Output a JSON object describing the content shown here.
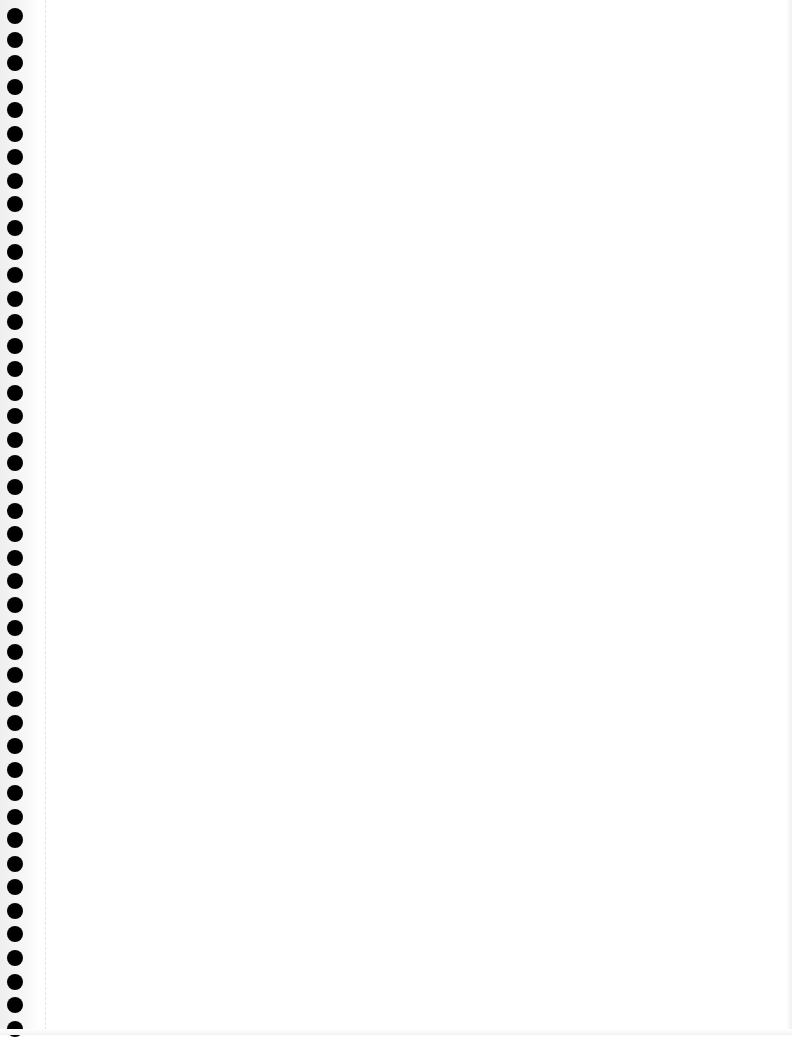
{
  "page": {
    "type": "blank spiral notebook page",
    "background_color": "#ffffff",
    "hole_color": "#000000",
    "hole_count": 44,
    "content": ""
  }
}
